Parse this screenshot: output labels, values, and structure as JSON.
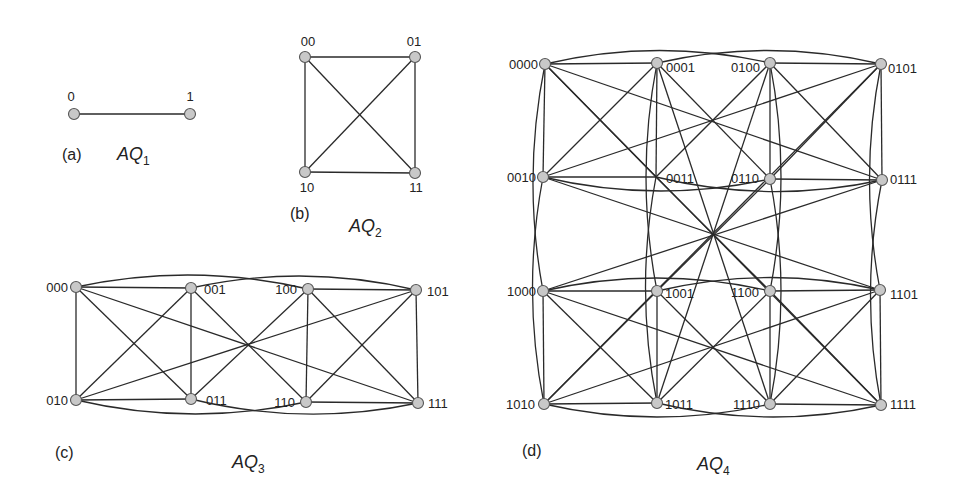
{
  "figure": {
    "panels": [
      {
        "id": "a",
        "panel_label": "(a)",
        "title": "AQ",
        "subscript": "1",
        "panel_label_pos": [
          62,
          160
        ],
        "title_pos": [
          117,
          160
        ],
        "nodes": [
          {
            "id": "0",
            "x": 74,
            "y": 114,
            "lx": 71,
            "ly": 101,
            "anchor": "middle"
          },
          {
            "id": "1",
            "x": 190,
            "y": 114,
            "lx": 190,
            "ly": 101,
            "anchor": "middle"
          }
        ],
        "edges": [
          [
            "0",
            "1",
            "line"
          ]
        ]
      },
      {
        "id": "b",
        "panel_label": "(b)",
        "title": "AQ",
        "subscript": "2",
        "panel_label_pos": [
          290,
          219
        ],
        "title_pos": [
          349,
          232
        ],
        "nodes": [
          {
            "id": "00",
            "x": 305,
            "y": 57,
            "lx": 308,
            "ly": 46,
            "anchor": "middle"
          },
          {
            "id": "01",
            "x": 415,
            "y": 57,
            "lx": 414,
            "ly": 46,
            "anchor": "middle"
          },
          {
            "id": "10",
            "x": 305,
            "y": 172,
            "lx": 307,
            "ly": 192,
            "anchor": "middle"
          },
          {
            "id": "11",
            "x": 415,
            "y": 173,
            "lx": 416,
            "ly": 192,
            "anchor": "middle"
          }
        ],
        "edges": [
          [
            "00",
            "01",
            "line"
          ],
          [
            "00",
            "10",
            "line"
          ],
          [
            "01",
            "11",
            "line"
          ],
          [
            "10",
            "11",
            "line"
          ],
          [
            "00",
            "11",
            "line"
          ],
          [
            "01",
            "10",
            "line"
          ]
        ]
      },
      {
        "id": "c",
        "panel_label": "(c)",
        "title": "AQ",
        "subscript": "3",
        "panel_label_pos": [
          55,
          458
        ],
        "title_pos": [
          232,
          468
        ],
        "nodes": [
          {
            "id": "000",
            "x": 76,
            "y": 287,
            "lx": 68,
            "ly": 292,
            "anchor": "end"
          },
          {
            "id": "001",
            "x": 191,
            "y": 288,
            "lx": 204,
            "ly": 294,
            "anchor": "start"
          },
          {
            "id": "100",
            "x": 308,
            "y": 289,
            "lx": 297,
            "ly": 294,
            "anchor": "end"
          },
          {
            "id": "101",
            "x": 416,
            "y": 290,
            "lx": 427,
            "ly": 296,
            "anchor": "start"
          },
          {
            "id": "010",
            "x": 76,
            "y": 400,
            "lx": 68,
            "ly": 405,
            "anchor": "end"
          },
          {
            "id": "011",
            "x": 191,
            "y": 399,
            "lx": 206,
            "ly": 405,
            "anchor": "start"
          },
          {
            "id": "110",
            "x": 306,
            "y": 402,
            "lx": 295,
            "ly": 407,
            "anchor": "end"
          },
          {
            "id": "111",
            "x": 418,
            "y": 403,
            "lx": 428,
            "ly": 408,
            "anchor": "start"
          }
        ],
        "edges": [
          [
            "000",
            "001",
            "line"
          ],
          [
            "100",
            "101",
            "line"
          ],
          [
            "010",
            "011",
            "line"
          ],
          [
            "110",
            "111",
            "line"
          ],
          [
            "000",
            "010",
            "line"
          ],
          [
            "001",
            "011",
            "line"
          ],
          [
            "100",
            "110",
            "line"
          ],
          [
            "101",
            "111",
            "line"
          ],
          [
            "000",
            "011",
            "line"
          ],
          [
            "001",
            "010",
            "line"
          ],
          [
            "100",
            "111",
            "line"
          ],
          [
            "101",
            "110",
            "line"
          ],
          [
            "000",
            "111",
            "line"
          ],
          [
            "001",
            "110",
            "line"
          ],
          [
            "010",
            "101",
            "line"
          ],
          [
            "011",
            "100",
            "line"
          ],
          [
            "000",
            "100",
            "arc-up"
          ],
          [
            "001",
            "101",
            "arc-up"
          ],
          [
            "010",
            "110",
            "arc-down"
          ],
          [
            "011",
            "111",
            "arc-down"
          ]
        ]
      },
      {
        "id": "d",
        "panel_label": "(d)",
        "title": "AQ",
        "subscript": "4",
        "panel_label_pos": [
          522,
          456
        ],
        "title_pos": [
          697,
          470
        ],
        "nodes": [
          {
            "id": "0000",
            "x": 545,
            "y": 64,
            "lx": 538,
            "ly": 69,
            "anchor": "end"
          },
          {
            "id": "0001",
            "x": 657,
            "y": 63,
            "lx": 666,
            "ly": 72,
            "anchor": "start"
          },
          {
            "id": "0100",
            "x": 770,
            "y": 63,
            "lx": 760,
            "ly": 72,
            "anchor": "end"
          },
          {
            "id": "0101",
            "x": 881,
            "y": 64,
            "lx": 888,
            "ly": 73,
            "anchor": "start"
          },
          {
            "id": "0010",
            "x": 543,
            "y": 177,
            "lx": 536,
            "ly": 182,
            "anchor": "end"
          },
          {
            "id": "0011",
            "x": 656,
            "y": 177,
            "lx": 666,
            "ly": 183,
            "anchor": "start",
            "hollow": true
          },
          {
            "id": "0110",
            "x": 770,
            "y": 179,
            "lx": 759,
            "ly": 183,
            "anchor": "end"
          },
          {
            "id": "0111",
            "x": 882,
            "y": 180,
            "lx": 890,
            "ly": 184,
            "anchor": "start"
          },
          {
            "id": "1000",
            "x": 543,
            "y": 291,
            "lx": 536,
            "ly": 296,
            "anchor": "end"
          },
          {
            "id": "1001",
            "x": 657,
            "y": 291,
            "lx": 665,
            "ly": 298,
            "anchor": "start"
          },
          {
            "id": "1100",
            "x": 770,
            "y": 291,
            "lx": 759,
            "ly": 297,
            "anchor": "end"
          },
          {
            "id": "1101",
            "x": 880,
            "y": 290,
            "lx": 890,
            "ly": 299,
            "anchor": "start"
          },
          {
            "id": "1010",
            "x": 544,
            "y": 404,
            "lx": 535,
            "ly": 409,
            "anchor": "end"
          },
          {
            "id": "1011",
            "x": 657,
            "y": 403,
            "lx": 665,
            "ly": 409,
            "anchor": "start"
          },
          {
            "id": "1110",
            "x": 770,
            "y": 404,
            "lx": 760,
            "ly": 409,
            "anchor": "end"
          },
          {
            "id": "1111",
            "x": 881,
            "y": 405,
            "lx": 890,
            "ly": 409,
            "anchor": "start"
          }
        ],
        "edges": [
          [
            "0000",
            "0001",
            "line"
          ],
          [
            "0100",
            "0101",
            "line"
          ],
          [
            "0010",
            "0011",
            "line"
          ],
          [
            "0110",
            "0111",
            "line"
          ],
          [
            "0000",
            "0010",
            "line"
          ],
          [
            "0001",
            "0011",
            "line"
          ],
          [
            "0100",
            "0110",
            "line"
          ],
          [
            "0101",
            "0111",
            "line"
          ],
          [
            "0000",
            "0011",
            "line"
          ],
          [
            "0001",
            "0010",
            "line"
          ],
          [
            "0100",
            "0111",
            "line"
          ],
          [
            "0101",
            "0110",
            "line"
          ],
          [
            "0000",
            "0111",
            "line"
          ],
          [
            "0001",
            "0110",
            "line"
          ],
          [
            "0010",
            "0101",
            "line"
          ],
          [
            "0011",
            "0100",
            "line"
          ],
          [
            "0000",
            "0100",
            "arc-up"
          ],
          [
            "0001",
            "0101",
            "arc-up"
          ],
          [
            "0010",
            "0110",
            "arc-down"
          ],
          [
            "0011",
            "0111",
            "arc-down"
          ],
          [
            "1000",
            "1001",
            "line"
          ],
          [
            "1100",
            "1101",
            "line"
          ],
          [
            "1010",
            "1011",
            "line"
          ],
          [
            "1110",
            "1111",
            "line"
          ],
          [
            "1000",
            "1010",
            "line"
          ],
          [
            "1001",
            "1011",
            "line"
          ],
          [
            "1100",
            "1110",
            "line"
          ],
          [
            "1101",
            "1111",
            "line"
          ],
          [
            "1000",
            "1011",
            "line"
          ],
          [
            "1001",
            "1010",
            "line"
          ],
          [
            "1100",
            "1111",
            "line"
          ],
          [
            "1101",
            "1110",
            "line"
          ],
          [
            "1000",
            "1111",
            "line"
          ],
          [
            "1001",
            "1110",
            "line"
          ],
          [
            "1010",
            "1101",
            "line"
          ],
          [
            "1011",
            "1100",
            "line"
          ],
          [
            "1000",
            "1100",
            "arc-up"
          ],
          [
            "1001",
            "1101",
            "arc-up"
          ],
          [
            "1010",
            "1110",
            "arc-down"
          ],
          [
            "1011",
            "1111",
            "arc-down"
          ],
          [
            "0000",
            "1000",
            "arc-left"
          ],
          [
            "0001",
            "1001",
            "arc-left"
          ],
          [
            "0100",
            "1100",
            "arc-right"
          ],
          [
            "0101",
            "1101",
            "arc-left"
          ],
          [
            "0010",
            "1010",
            "arc-left"
          ],
          [
            "0011",
            "1011",
            "arc-left"
          ],
          [
            "0110",
            "1110",
            "arc-right"
          ],
          [
            "0111",
            "1111",
            "arc-left"
          ],
          [
            "0000",
            "1111",
            "line"
          ],
          [
            "0001",
            "1110",
            "line"
          ],
          [
            "0100",
            "1011",
            "line"
          ],
          [
            "0101",
            "1010",
            "line"
          ],
          [
            "0010",
            "1101",
            "line"
          ],
          [
            "0011",
            "1100",
            "line"
          ],
          [
            "0110",
            "1001",
            "line"
          ],
          [
            "0111",
            "1000",
            "line"
          ]
        ]
      }
    ],
    "style": {
      "node_fill": "#c8c8c8",
      "node_stroke": "#555555",
      "edge_color": "#2a2a2a",
      "background": "#ffffff"
    }
  }
}
